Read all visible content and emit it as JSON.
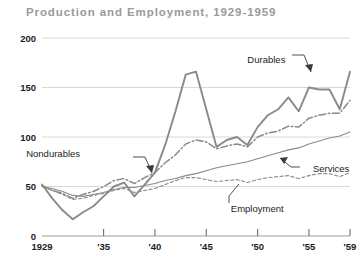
{
  "chart_data": {
    "type": "line",
    "title": "Production and Employment, 1929-1959",
    "xlabel": "",
    "ylabel": "",
    "xlim": [
      1929,
      1959
    ],
    "ylim": [
      0,
      200
    ],
    "grid": true,
    "legend_position": "inline-annotations",
    "ytick_labels": [
      "200",
      "150",
      "100",
      "50",
      "0"
    ],
    "ytick_values": [
      200,
      150,
      100,
      50,
      0
    ],
    "xtick_labels": [
      "1929",
      "'35",
      "'40",
      "'45",
      "'50",
      "'55",
      "'59"
    ],
    "xtick_values": [
      1929,
      1935,
      1940,
      1945,
      1950,
      1955,
      1959
    ],
    "x": [
      1929,
      1930,
      1931,
      1932,
      1933,
      1934,
      1935,
      1936,
      1937,
      1938,
      1939,
      1940,
      1941,
      1942,
      1943,
      1944,
      1945,
      1946,
      1947,
      1948,
      1949,
      1950,
      1951,
      1952,
      1953,
      1954,
      1955,
      1956,
      1957,
      1958,
      1959
    ],
    "series": [
      {
        "name": "Durables",
        "style": "solid",
        "color": "#8a8a8a",
        "label": "Durables",
        "values": [
          52,
          38,
          26,
          17,
          24,
          30,
          40,
          50,
          54,
          40,
          52,
          64,
          92,
          126,
          163,
          166,
          128,
          90,
          97,
          100,
          92,
          110,
          122,
          128,
          140,
          126,
          150,
          148,
          148,
          128,
          166
        ]
      },
      {
        "name": "Nondurables",
        "style": "dashdot",
        "color": "#8a8a8a",
        "label": "Nondurables",
        "values": [
          51,
          46,
          43,
          38,
          42,
          45,
          50,
          56,
          58,
          53,
          59,
          64,
          74,
          82,
          93,
          97,
          95,
          88,
          91,
          93,
          90,
          100,
          104,
          106,
          111,
          110,
          119,
          122,
          124,
          124,
          137
        ]
      },
      {
        "name": "Services",
        "style": "solid-thin",
        "color": "#8a8a8a",
        "label": "Services",
        "values": [
          50,
          48,
          45,
          41,
          40,
          42,
          44,
          47,
          49,
          49,
          51,
          53,
          56,
          58,
          61,
          63,
          66,
          69,
          71,
          73,
          75,
          78,
          81,
          84,
          87,
          89,
          93,
          96,
          99,
          101,
          105
        ]
      },
      {
        "name": "Employment",
        "style": "dotted",
        "color": "#8a8a8a",
        "label": "Employment",
        "values": [
          50,
          46,
          42,
          37,
          38,
          41,
          43,
          46,
          48,
          44,
          46,
          48,
          52,
          56,
          59,
          59,
          57,
          55,
          56,
          57,
          54,
          57,
          59,
          60,
          61,
          58,
          61,
          63,
          63,
          60,
          64
        ]
      }
    ],
    "annotations": [
      {
        "text": "Durables",
        "x": 1953,
        "y": 178
      },
      {
        "text": "Nondurables",
        "x": 1933,
        "y": 83
      },
      {
        "text": "Services",
        "x": 1955,
        "y": 68
      },
      {
        "text": "Employment",
        "x": 1947,
        "y": 28
      }
    ]
  }
}
